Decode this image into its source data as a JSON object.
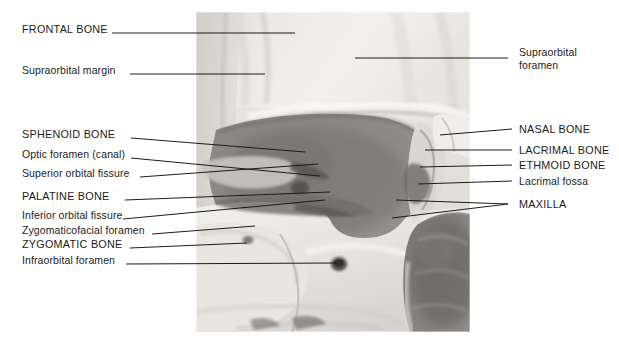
{
  "figure": {
    "kind": "anatomical-photograph",
    "photo_region": {
      "x": 196,
      "y": 12,
      "width": 274,
      "height": 320
    }
  },
  "labels_left": [
    {
      "id": "frontal-bone",
      "text": "FRONTAL BONE",
      "style": "caps",
      "x": 22,
      "y": 29,
      "leader": [
        [
          112,
          33
        ],
        [
          295,
          33
        ]
      ]
    },
    {
      "id": "supraorbital-margin",
      "text": "Supraorbital margin",
      "style": "lower",
      "x": 22,
      "y": 70,
      "leader": [
        [
          130,
          74
        ],
        [
          265,
          74
        ]
      ]
    },
    {
      "id": "sphenoid-bone",
      "text": "SPHENOID BONE",
      "style": "caps",
      "x": 22,
      "y": 134,
      "leader": [
        [
          131,
          138
        ],
        [
          305,
          152
        ]
      ]
    },
    {
      "id": "optic-foramen-canal",
      "text": "Optic foramen (canal)",
      "style": "lower",
      "x": 22,
      "y": 154,
      "leader": [
        [
          131,
          158
        ],
        [
          320,
          176
        ]
      ]
    },
    {
      "id": "superior-orbital-fissure",
      "text": "Superior orbital fissure",
      "style": "lower",
      "x": 22,
      "y": 173,
      "leader": [
        [
          140,
          177
        ],
        [
          318,
          164
        ]
      ]
    },
    {
      "id": "palatine-bone",
      "text": "PALATINE BONE",
      "style": "caps",
      "x": 22,
      "y": 196,
      "leader": [
        [
          125,
          200
        ],
        [
          330,
          192
        ]
      ]
    },
    {
      "id": "inferior-orbital-fissure",
      "text": "Inferior orbital fissure",
      "style": "lower",
      "x": 22,
      "y": 215,
      "leader": [
        [
          123,
          219
        ],
        [
          325,
          200
        ]
      ]
    },
    {
      "id": "zygomaticofacial-foramen",
      "text": "Zygomaticofacial foramen",
      "style": "lower",
      "x": 22,
      "y": 230,
      "leader": [
        [
          152,
          234
        ],
        [
          255,
          226
        ]
      ]
    },
    {
      "id": "zygomatic-bone",
      "text": "ZYGOMATIC BONE",
      "style": "caps",
      "x": 22,
      "y": 244,
      "leader": [
        [
          130,
          248
        ],
        [
          247,
          243
        ]
      ]
    },
    {
      "id": "infraorbital-foramen",
      "text": "Infraorbital foramen",
      "style": "lower",
      "x": 22,
      "y": 260,
      "leader": [
        [
          126,
          264
        ],
        [
          337,
          263
        ]
      ]
    }
  ],
  "labels_right": [
    {
      "id": "supraorbital-foramen",
      "text": "Supraorbital foramen",
      "style": "lower",
      "x": 519,
      "y": 52,
      "multiline": [
        "Supraorbital",
        "foramen"
      ],
      "leader": [
        [
          508,
          58
        ],
        [
          355,
          58
        ]
      ]
    },
    {
      "id": "nasal-bone",
      "text": "NASAL BONE",
      "style": "caps",
      "x": 519,
      "y": 124,
      "leader": [
        [
          512,
          129
        ],
        [
          440,
          135
        ]
      ]
    },
    {
      "id": "lacrimal-bone",
      "text": "LACRIMAL BONE",
      "style": "caps",
      "x": 519,
      "y": 145,
      "leader": [
        [
          512,
          150
        ],
        [
          425,
          150
        ]
      ]
    },
    {
      "id": "ethmoid-bone",
      "text": "ETHMOID BONE",
      "style": "caps",
      "x": 519,
      "y": 160,
      "leader": [
        [
          512,
          165
        ],
        [
          420,
          167
        ]
      ]
    },
    {
      "id": "lacrimal-fossa",
      "text": "Lacrimal fossa",
      "style": "lower",
      "x": 519,
      "y": 176,
      "leader": [
        [
          512,
          181
        ],
        [
          418,
          184
        ]
      ]
    },
    {
      "id": "maxilla",
      "text": "MAXILLA",
      "style": "caps",
      "x": 519,
      "y": 199,
      "leader": [
        [
          508,
          204
        ],
        [
          396,
          200
        ]
      ],
      "leader2": [
        [
          508,
          204
        ],
        [
          392,
          218
        ]
      ]
    }
  ],
  "colors": {
    "background": "#ffffff",
    "leader_line": "#1b1b1b",
    "text": "#1b1b1b",
    "bone_light": "#f2f0ee",
    "bone_mid": "#d6d3cf",
    "bone_shadow": "#b4b0ab",
    "orbit_cavity": "#8d8a86",
    "nasal_cavity": "#7d7a77",
    "deep_shadow": "#5a5754"
  }
}
